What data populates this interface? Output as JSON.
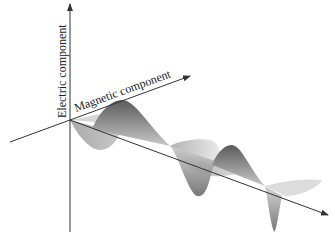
{
  "diagram": {
    "labels": {
      "electric_axis": "Electric component",
      "magnetic_axis": "Magnetic component"
    },
    "colors": {
      "axis": "#333333",
      "electric_wave_dark": "#5a5a5a",
      "electric_wave_light": "#bdbdbd",
      "magnetic_wave_dark": "#8a8a8a",
      "magnetic_wave_light": "#dcdcdc",
      "background": "#ffffff"
    }
  }
}
